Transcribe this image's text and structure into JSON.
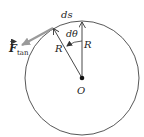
{
  "diagram": {
    "labels": {
      "ds": "ds",
      "dtheta": "dθ",
      "radius_vertical": "R",
      "radius_slanted": "R",
      "origin": "O",
      "force_main": "F",
      "force_sub": "tan"
    },
    "colors": {
      "line": "#333333",
      "force": "#9a9a9a",
      "background": "#ffffff"
    },
    "geometry": {
      "center": [
        82,
        78
      ],
      "radius": 57,
      "top_point": [
        82,
        21
      ],
      "slanted_point": [
        53,
        28
      ],
      "force_tip": [
        20,
        46
      ]
    }
  }
}
